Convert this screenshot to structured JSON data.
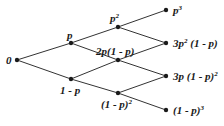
{
  "diagram": {
    "type": "probability tree",
    "nodes": {
      "root": {
        "label": "0"
      },
      "l1_up": {
        "label": "p"
      },
      "l1_down": {
        "label": "1 - p"
      },
      "l2_top": {
        "base": "p",
        "exp": "2"
      },
      "l2_mid": {
        "label": "2p(1 - p)"
      },
      "l2_bot": {
        "base": "(1 - p)",
        "exp": "2"
      },
      "l3_a": {
        "base": "p",
        "exp": "3"
      },
      "l3_b": {
        "pre": "3p",
        "exp": "2",
        "post": " (1 - p)"
      },
      "l3_c": {
        "pre": "3p (1 - p)",
        "exp": "2"
      },
      "l3_d": {
        "pre": "(1 - p)",
        "exp": "3"
      }
    },
    "colors": {
      "line": "#333333",
      "dot": "#1a1a1a",
      "text": "#1a1a1a"
    }
  }
}
